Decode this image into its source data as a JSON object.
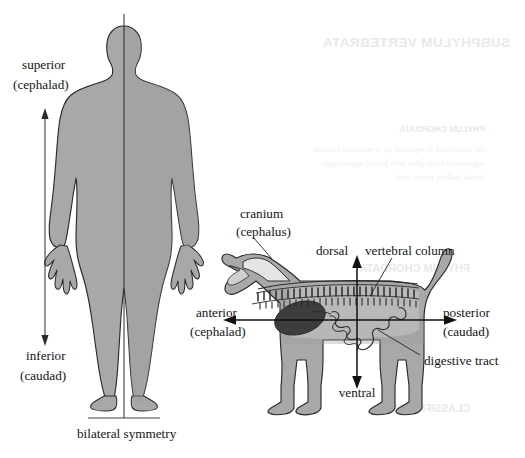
{
  "figure": {
    "title_alt": "Body symmetry and directional terminology",
    "background_color": "#ffffff",
    "body_fill": "#a8a8a8",
    "body_fill_light": "#c9c9c9",
    "cavity_fill": "#e2e2e2",
    "organ_fill": "#3d3d3d",
    "outline_color": "#2b2b2b",
    "text_color": "#141414",
    "bleed_color": "#ededed"
  },
  "human_panel": {
    "name": "human-bilateral-symmetry-panel",
    "axis_label_top": {
      "line1": "superior",
      "line2": "(cephalad)"
    },
    "axis_label_bottom": {
      "line1": "inferior",
      "line2": "(caudad)"
    },
    "caption": "bilateral symmetry",
    "midline_name": "midsagittal-line"
  },
  "dog_panel": {
    "name": "dog-directional-terms-panel",
    "labels": {
      "cranium": {
        "line1": "cranium",
        "line2": "(cephalus)"
      },
      "dorsal": "dorsal",
      "ventral": "ventral",
      "vertebral_column": "vertebral column",
      "digestive_tract": "digestive tract",
      "anterior": {
        "line1": "anterior",
        "line2": "(cephalad)"
      },
      "posterior": {
        "line1": "posterior",
        "line2": "(caudad)"
      }
    }
  },
  "bleed_through": {
    "heading": "SUBPHYLUM VERTEBRATA",
    "subheading": "PHYLUM CHORDATA",
    "body_line_1": "the notochord is replaced by a vertebral column",
    "body_line_2": "segmented body plan with paired appendages",
    "body_line_3": "dorsal hollow nerve cord",
    "footer": "CLASSIFICATION"
  }
}
